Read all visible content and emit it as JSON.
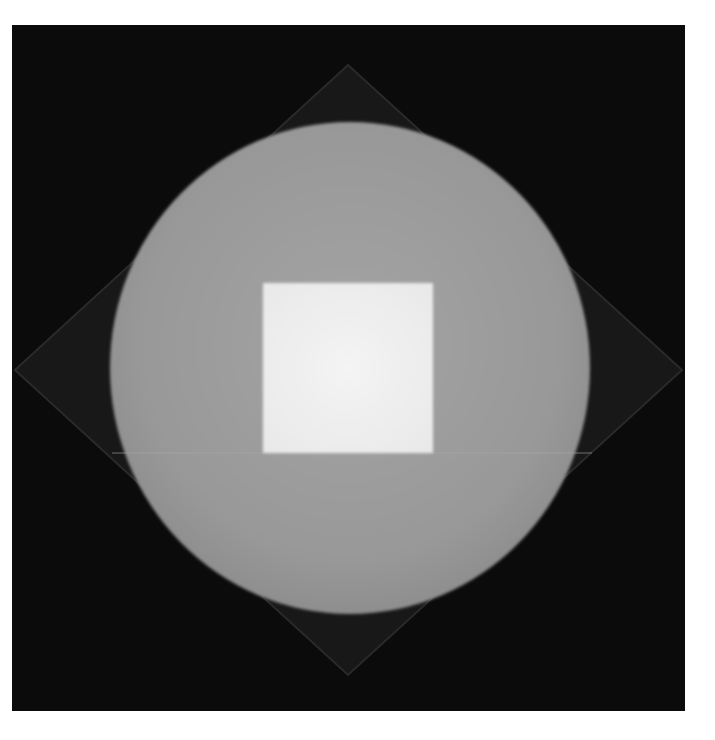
{
  "artwork": {
    "description": "Grayscale painting: light gray circle with a white square at center over a faint dark diamond on a black square ground",
    "colors": {
      "page_background": "#ffffff",
      "ground": "#0b0b0b",
      "diamond": "#1c1c1c",
      "diamond_edge": "#2a2a2a",
      "circle": "#9a9a9a",
      "square": "#f0f0f0"
    }
  }
}
